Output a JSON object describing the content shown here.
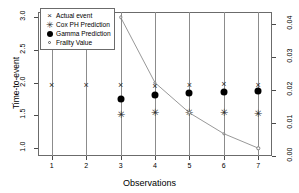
{
  "chart_data": {
    "type": "scatter",
    "title": "",
    "xlabel": "Observations",
    "ylabel": "Time-to-event",
    "ylabel_right": "",
    "x": [
      1,
      2,
      3,
      4,
      5,
      6,
      7
    ],
    "xticklabels": [
      "1",
      "2",
      "3",
      "4",
      "5",
      "6",
      "7"
    ],
    "xlim": [
      0.6,
      7.4
    ],
    "ylim": [
      0.88,
      3.08
    ],
    "yticks": [
      1.0,
      1.5,
      2.0,
      2.5,
      3.0
    ],
    "yticklabels": [
      "1.0",
      "1.5",
      "2.0",
      "2.5",
      "3.0"
    ],
    "y2ticks": [
      0.0,
      0.01,
      0.02,
      0.03,
      0.04
    ],
    "y2ticklabels": [
      "0.00",
      "0.01",
      "0.02",
      "0.03",
      "0.04"
    ],
    "y2lim": [
      0.0,
      0.0435
    ],
    "grid": "vertical",
    "legend_position": "top-left",
    "series": [
      {
        "name": "Actual event",
        "marker": "x",
        "axis": "left",
        "x": [
          1,
          2,
          3,
          4,
          5,
          6,
          7
        ],
        "values": [
          1.97,
          1.97,
          1.97,
          1.95,
          1.97,
          1.98,
          1.97
        ]
      },
      {
        "name": "Cox PH Prediction",
        "marker": "asterisk",
        "axis": "left",
        "x": [
          3,
          4,
          5,
          6,
          7
        ],
        "values": [
          1.51,
          1.53,
          1.54,
          1.53,
          1.52
        ]
      },
      {
        "name": "Gamma Prediction",
        "marker": "filled-circle",
        "axis": "left",
        "x": [
          3,
          4,
          5,
          6,
          7
        ],
        "values": [
          1.75,
          1.81,
          1.84,
          1.86,
          1.87
        ]
      },
      {
        "name": "Frailty Value",
        "marker": "open-circle",
        "axis": "right",
        "line": true,
        "x": [
          3,
          4,
          5,
          6,
          7
        ],
        "values": [
          0.0435,
          0.0217,
          0.0107,
          0.0063,
          0.0024
        ],
        "values_left_scale": [
          3.0,
          2.0,
          1.54,
          1.22,
          1.0
        ]
      }
    ]
  },
  "legend": {
    "items": [
      {
        "label": "Actual event",
        "marker": "x"
      },
      {
        "label": "Cox PH Prediction",
        "marker": "asterisk"
      },
      {
        "label": "Gamma Prediction",
        "marker": "filled-circle"
      },
      {
        "label": "Frailty Value",
        "marker": "open-circle"
      }
    ]
  },
  "colors": {
    "axis": "#4a4a4a",
    "grid": "#8c8c8c",
    "marker": "#2b2b2b",
    "dot": "#000000",
    "curve": "#7d7d7d"
  }
}
